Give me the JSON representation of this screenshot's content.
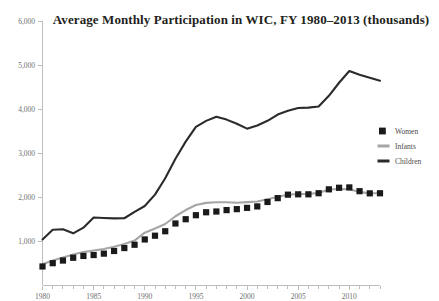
{
  "chart_data": {
    "type": "line",
    "title": "Average Monthly Participation in WIC, FY 1980–2013 (thousands)",
    "xlabel": "",
    "ylabel": "",
    "ylim": [
      0,
      6000
    ],
    "xlim": [
      1980,
      2013
    ],
    "grid": false,
    "legend_position": "right",
    "ytick_labels": [
      "6,000",
      "5,000",
      "4,000",
      "3,000",
      "2,000",
      "1,000"
    ],
    "ytick_values": [
      6000,
      5000,
      4000,
      3000,
      2000,
      1000
    ],
    "xtick_labels": [
      "1980",
      "1985",
      "1990",
      "1995",
      "2000",
      "2005",
      "2010"
    ],
    "xtick_values": [
      1980,
      1985,
      1990,
      1995,
      2000,
      2005,
      2010
    ],
    "x": [
      1980,
      1981,
      1982,
      1983,
      1984,
      1985,
      1986,
      1987,
      1988,
      1989,
      1990,
      1991,
      1992,
      1993,
      1994,
      1995,
      1996,
      1997,
      1998,
      1999,
      2000,
      2001,
      2002,
      2003,
      2004,
      2005,
      2006,
      2007,
      2008,
      2009,
      2010,
      2011,
      2012,
      2013
    ],
    "series": [
      {
        "name": "Women",
        "style": "marker",
        "color": "#1a1a1a",
        "values": [
          421,
          496,
          556,
          619,
          660,
          681,
          713,
          773,
          840,
          915,
          1035,
          1120,
          1222,
          1398,
          1495,
          1586,
          1653,
          1670,
          1702,
          1724,
          1753,
          1786,
          1887,
          1974,
          2053,
          2061,
          2061,
          2086,
          2174,
          2210,
          2218,
          2132,
          2083,
          2085
        ]
      },
      {
        "name": "Infants",
        "style": "line",
        "color": "#a6a6a6",
        "values": [
          473,
          558,
          626,
          695,
          748,
          783,
          818,
          871,
          934,
          1010,
          1189,
          1285,
          1387,
          1563,
          1704,
          1819,
          1866,
          1879,
          1881,
          1870,
          1883,
          1899,
          1948,
          2006,
          2053,
          2065,
          2071,
          2092,
          2169,
          2181,
          2175,
          2116,
          2081,
          2092
        ]
      },
      {
        "name": "Children",
        "style": "line",
        "color": "#2b2b2b",
        "values": [
          1035,
          1254,
          1266,
          1174,
          1303,
          1534,
          1524,
          1514,
          1517,
          1662,
          1796,
          2054,
          2427,
          2871,
          3258,
          3595,
          3730,
          3823,
          3759,
          3664,
          3553,
          3625,
          3732,
          3874,
          3961,
          4022,
          4032,
          4057,
          4299,
          4597,
          4863,
          4778,
          4710,
          4643
        ]
      }
    ],
    "legend": [
      {
        "label": "Women",
        "marker": "square",
        "color": "#1a1a1a"
      },
      {
        "label": "Infants",
        "marker": "line",
        "color": "#a6a6a6"
      },
      {
        "label": "Children",
        "marker": "line",
        "color": "#2b2b2b"
      }
    ]
  }
}
